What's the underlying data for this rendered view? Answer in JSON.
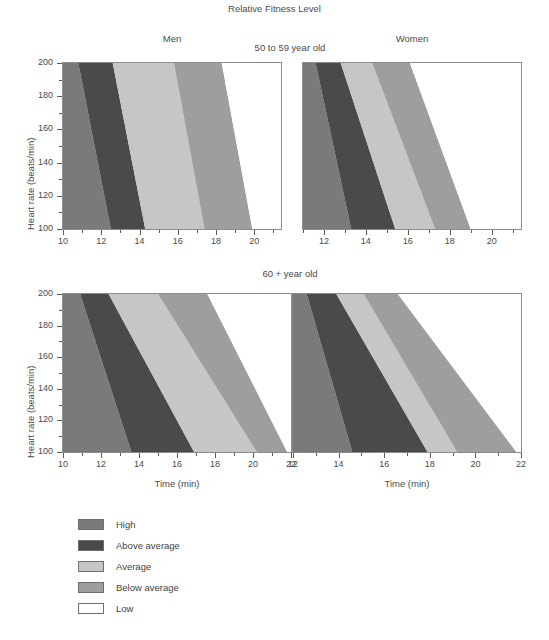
{
  "chart_data": {
    "type": "area",
    "title": "Relative Fitness Level",
    "xlabel": "Time (min)",
    "ylabel": "Heart rate (beats/min)",
    "ylim": [
      100,
      200
    ],
    "yticks": [
      100,
      120,
      140,
      160,
      180,
      200
    ],
    "yminor_step": 10,
    "grid": false,
    "legend_position": "bottom-left",
    "legend": [
      {
        "label": "High",
        "color": "#7a7a7a"
      },
      {
        "label": "Above average",
        "color": "#4a4a4a"
      },
      {
        "label": "Average",
        "color": "#c6c6c6"
      },
      {
        "label": "Below average",
        "color": "#9e9e9e"
      },
      {
        "label": "Low",
        "color": "#ffffff"
      }
    ],
    "column_labels": [
      "Men",
      "Women"
    ],
    "row_labels": [
      "50 to 59 year old",
      "60 + year old"
    ],
    "panels": [
      {
        "id": "men-50-59",
        "column_label": "Men",
        "row_label": "50 to 59 year old",
        "xlim": [
          10,
          21.4
        ],
        "xticks": [
          10,
          12,
          14,
          16,
          18,
          20
        ],
        "xminor_step": 1,
        "bands": [
          {
            "label": "High",
            "color": "#7a7a7a",
            "x_at_y200": 10.0,
            "x_at_y100": 10.0
          },
          {
            "label": "Above average",
            "color": "#4a4a4a",
            "x_at_y200": 10.8,
            "x_at_y100": 12.5
          },
          {
            "label": "Average",
            "color": "#c6c6c6",
            "x_at_y200": 12.6,
            "x_at_y100": 14.3
          },
          {
            "label": "Below average",
            "color": "#9e9e9e",
            "x_at_y200": 15.8,
            "x_at_y100": 17.4
          },
          {
            "label": "Low",
            "color": "#ffffff",
            "x_at_y200": 18.3,
            "x_at_y100": 19.9
          }
        ]
      },
      {
        "id": "women-50-59",
        "column_label": "Women",
        "row_label": "50 to 59 year old",
        "xlim": [
          11.0,
          21.4
        ],
        "xticks": [
          12,
          14,
          16,
          18,
          20
        ],
        "xminor_step": 1,
        "bands": [
          {
            "label": "High",
            "color": "#7a7a7a",
            "x_at_y200": 11.0,
            "x_at_y100": 11.0
          },
          {
            "label": "Above average",
            "color": "#4a4a4a",
            "x_at_y200": 11.6,
            "x_at_y100": 13.3
          },
          {
            "label": "Average",
            "color": "#c6c6c6",
            "x_at_y200": 12.8,
            "x_at_y100": 15.4
          },
          {
            "label": "Below average",
            "color": "#9e9e9e",
            "x_at_y200": 14.3,
            "x_at_y100": 17.3
          },
          {
            "label": "Low",
            "color": "#ffffff",
            "x_at_y200": 16.1,
            "x_at_y100": 19.0
          }
        ]
      },
      {
        "id": "men-60plus",
        "column_label": "Men",
        "row_label": "60 + year old",
        "xlim": [
          10,
          22
        ],
        "xticks": [
          10,
          12,
          14,
          16,
          18,
          20,
          22
        ],
        "xminor_step": 1,
        "bands": [
          {
            "label": "High",
            "color": "#7a7a7a",
            "x_at_y200": 10.0,
            "x_at_y100": 10.0
          },
          {
            "label": "Above average",
            "color": "#4a4a4a",
            "x_at_y200": 10.9,
            "x_at_y100": 13.6
          },
          {
            "label": "Average",
            "color": "#c6c6c6",
            "x_at_y200": 12.4,
            "x_at_y100": 16.9
          },
          {
            "label": "Below average",
            "color": "#9e9e9e",
            "x_at_y200": 15.0,
            "x_at_y100": 20.2
          },
          {
            "label": "Low",
            "color": "#ffffff",
            "x_at_y200": 17.6,
            "x_at_y100": 21.8
          }
        ]
      },
      {
        "id": "women-60plus",
        "column_label": "Women",
        "row_label": "60 + year old",
        "xlim": [
          12,
          22
        ],
        "xticks": [
          12,
          14,
          16,
          18,
          20,
          22
        ],
        "xminor_step": 1,
        "bands": [
          {
            "label": "High",
            "color": "#7a7a7a",
            "x_at_y200": 12.0,
            "x_at_y100": 12.0
          },
          {
            "label": "Above average",
            "color": "#4a4a4a",
            "x_at_y200": 12.6,
            "x_at_y100": 14.6
          },
          {
            "label": "Average",
            "color": "#c6c6c6",
            "x_at_y200": 13.9,
            "x_at_y100": 17.9
          },
          {
            "label": "Below average",
            "color": "#9e9e9e",
            "x_at_y200": 15.1,
            "x_at_y100": 19.2
          },
          {
            "label": "Low",
            "color": "#ffffff",
            "x_at_y200": 16.6,
            "x_at_y100": 21.8
          }
        ]
      }
    ]
  }
}
